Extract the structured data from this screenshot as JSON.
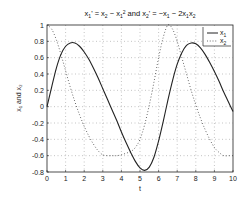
{
  "chart_data": {
    "type": "line",
    "xlabel": "t",
    "ylabel": "x1 and x2",
    "xlim": [
      0,
      10
    ],
    "ylim": [
      -0.8,
      1
    ],
    "xticks": [
      0,
      1,
      2,
      3,
      4,
      5,
      6,
      7,
      8,
      9,
      10
    ],
    "yticks": [
      -0.8,
      -0.6,
      -0.4,
      -0.2,
      0,
      0.2,
      0.4,
      0.6,
      0.8,
      1
    ],
    "grid": true,
    "legend_position": "upper right",
    "x": [
      0,
      0.25,
      0.5,
      0.75,
      1,
      1.25,
      1.5,
      1.75,
      2,
      2.25,
      2.5,
      2.75,
      3,
      3.25,
      3.5,
      3.75,
      4,
      4.25,
      4.5,
      4.75,
      5,
      5.25,
      5.5,
      5.75,
      6,
      6.25,
      6.5,
      6.75,
      7,
      7.25,
      7.5,
      7.75,
      8,
      8.25,
      8.5,
      8.75,
      9,
      9.25,
      9.5,
      9.75,
      10
    ],
    "series": [
      {
        "name": "x1",
        "style": "solid",
        "values": [
          0,
          0.24,
          0.47,
          0.64,
          0.74,
          0.78,
          0.78,
          0.74,
          0.67,
          0.58,
          0.47,
          0.35,
          0.22,
          0.09,
          -0.04,
          -0.17,
          -0.31,
          -0.44,
          -0.56,
          -0.67,
          -0.75,
          -0.78,
          -0.74,
          -0.62,
          -0.42,
          -0.18,
          0.08,
          0.32,
          0.52,
          0.66,
          0.75,
          0.78,
          0.77,
          0.72,
          0.64,
          0.54,
          0.43,
          0.31,
          0.18,
          0.06,
          -0.06
        ]
      },
      {
        "name": "x2",
        "style": "dotted",
        "values": [
          1,
          0.95,
          0.82,
          0.64,
          0.44,
          0.24,
          0.06,
          -0.1,
          -0.24,
          -0.36,
          -0.46,
          -0.54,
          -0.59,
          -0.6,
          -0.6,
          -0.6,
          -0.59,
          -0.57,
          -0.55,
          -0.5,
          -0.4,
          -0.22,
          0.02,
          0.3,
          0.6,
          0.85,
          1.0,
          0.95,
          0.8,
          0.6,
          0.4,
          0.2,
          0.02,
          -0.14,
          -0.28,
          -0.4,
          -0.5,
          -0.56,
          -0.6,
          -0.6,
          -0.6
        ]
      }
    ]
  },
  "labels": {
    "title_x1": "x",
    "title_sub1": "1",
    "title_eq1": "' = x",
    "title_sub2": "2",
    "title_minus": " − x",
    "title_sub3": "1",
    "title_sup": "2",
    "title_and": " and x",
    "title_sub4": "2",
    "title_eq2": "' = −x",
    "title_sub5": "1",
    "title_minus2": " − 2x",
    "title_sub6": "1",
    "title_x2": "x",
    "title_sub7": "2",
    "xlabel": "t",
    "ylabel": "x₁ and x₂",
    "legend_x1": "x",
    "legend_x1_sub": "1",
    "legend_x2": "x",
    "legend_x2_sub": "2"
  }
}
